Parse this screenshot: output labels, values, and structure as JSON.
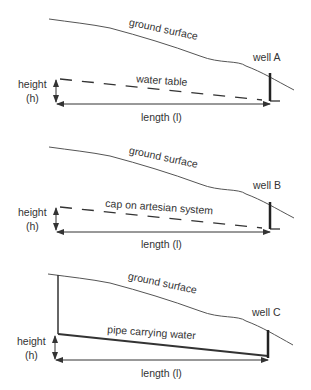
{
  "panels": [
    {
      "ground_label": "ground surface",
      "well_label": "well A",
      "line_label": "water table",
      "line_style": "dashed",
      "height_label": "height",
      "height_symbol": "(h)",
      "length_label": "length (l)"
    },
    {
      "ground_label": "ground surface",
      "well_label": "well B",
      "line_label": "cap on artesian system",
      "line_style": "dashed",
      "height_label": "height",
      "height_symbol": "(h)",
      "length_label": "length (l)"
    },
    {
      "ground_label": "ground surface",
      "well_label": "well C",
      "line_label": "pipe carrying water",
      "line_style": "solid",
      "height_label": "height",
      "height_symbol": "(h)",
      "length_label": "length (l)"
    }
  ],
  "colors": {
    "line": "#333333",
    "background": "#ffffff"
  }
}
